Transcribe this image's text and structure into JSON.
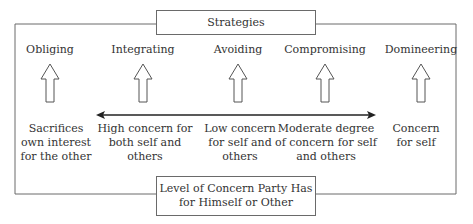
{
  "diagram": {
    "title": "Strategies",
    "bottom_box": {
      "line1": "Level of Concern Party Has",
      "line2": "for Himself or Other"
    },
    "strategies": [
      {
        "name": "Obliging",
        "desc": [
          "Sacrifices",
          "own interest",
          "for the other"
        ]
      },
      {
        "name": "Integrating",
        "desc": [
          "High concern for",
          "both self and",
          "others"
        ]
      },
      {
        "name": "Avoiding",
        "desc": [
          "Low concern",
          "for self and",
          "others"
        ]
      },
      {
        "name": "Compromising",
        "desc": [
          "Moderate degree",
          "of concern for self",
          "and others"
        ]
      },
      {
        "name": "Domineering",
        "desc": [
          "Concern",
          "for self"
        ]
      }
    ],
    "colors": {
      "line": "#6a6a6a",
      "text": "#333333",
      "arrow": "#222222"
    }
  }
}
